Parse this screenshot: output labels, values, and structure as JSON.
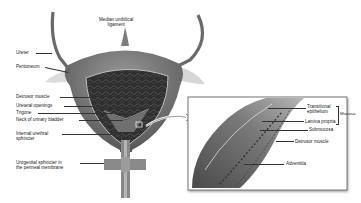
{
  "figure": {
    "main_labels": {
      "median_umbilical_ligament_1": "Median umbilical",
      "median_umbilical_ligament_2": "ligament",
      "ureter": "Ureter",
      "peritoneum": "Peritoneum",
      "detrusor_muscle": "Detrusor muscle",
      "ureteral_openings": "Ureteral openings",
      "trigone": "Trigone",
      "neck_of_urinary_bladder": "Neck of urinary bladder",
      "internal_urethral_sphincter_1": "Internal urethral",
      "internal_urethral_sphincter_2": "sphincter",
      "urogenital_sphincter_1": "Urogenital sphincter in",
      "urogenital_sphincter_2": "the perineal membrane"
    },
    "inset_labels": {
      "transitional_epithelium_1": "Transitional",
      "transitional_epithelium_2": "epithelium",
      "lamina_propria": "Lamina propria",
      "mucosa": "Mucosa",
      "submucosa": "Submucosa",
      "detrusor_muscle": "Detrusor muscle",
      "adventitia": "Adventitia"
    },
    "colors": {
      "bladder_outer": "#6e6e6e",
      "bladder_inner": "#3a3a3a",
      "peritoneum": "#d8d8d8",
      "inset_border": "#555555",
      "label_text": "#222222"
    }
  }
}
